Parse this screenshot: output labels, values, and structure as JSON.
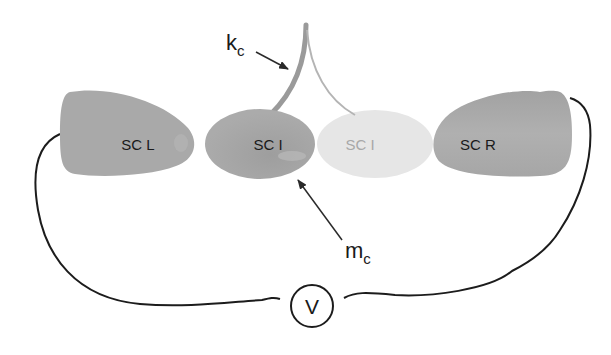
{
  "diagram": {
    "type": "circuit-schematic",
    "elements": {
      "sc_left": {
        "label": "SC L",
        "color": "#a9a9a9"
      },
      "sc_island": {
        "label": "SC I",
        "color": "#aaaaaa"
      },
      "sc_island_ghost": {
        "label": "SC I",
        "color": "#e6e6e6"
      },
      "sc_right": {
        "label": "SC R",
        "color": "#a6a6a6"
      },
      "cantilever": {
        "label": "k",
        "subscript": "c",
        "color": "#9a9a9a"
      },
      "mass": {
        "label": "m",
        "subscript": "c"
      },
      "voltmeter": {
        "label": "V"
      }
    },
    "colors": {
      "wire": "#1c1c1c",
      "arrow": "#2a2a2a",
      "background": "#ffffff"
    }
  }
}
